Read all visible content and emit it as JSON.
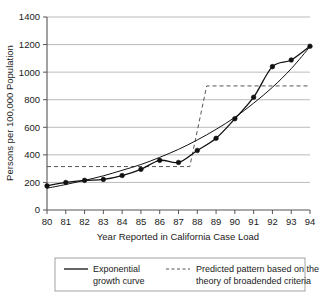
{
  "chart_data": {
    "type": "line",
    "title": "",
    "xlabel": "Year Reported in California Case Load",
    "ylabel": "Persons per 100,000 Population",
    "x": [
      80,
      81,
      82,
      83,
      84,
      85,
      86,
      87,
      88,
      89,
      90,
      91,
      92,
      93,
      94
    ],
    "xticklabels": [
      "80",
      "81",
      "82",
      "83",
      "84",
      "85",
      "86",
      "87",
      "88",
      "89",
      "90",
      "91",
      "92",
      "93",
      "94"
    ],
    "xlim": [
      80,
      94
    ],
    "ylim": [
      0,
      1400
    ],
    "yticks": [
      0,
      200,
      400,
      600,
      800,
      1000,
      1200,
      1400
    ],
    "yticklabels": [
      "0",
      "200",
      "400",
      "600",
      "800",
      "1000",
      "1200",
      "1400"
    ],
    "grid": "horizontal",
    "legend_position": "below-axes",
    "series": [
      {
        "name": "Observed case load (markers)",
        "style": "solid-with-markers",
        "values": [
          175,
          200,
          215,
          222,
          250,
          295,
          360,
          345,
          432,
          520,
          662,
          818,
          1040,
          1088,
          1188
        ]
      },
      {
        "name": "Exponential growth curve",
        "style": "solid",
        "values": [
          158,
          185,
          215,
          248,
          288,
          330,
          382,
          440,
          508,
          585,
          672,
          775,
          890,
          1025,
          1185
        ]
      },
      {
        "name": "Predicted pattern based on the theory of broadended criteria",
        "style": "dashed-step",
        "step_low": 315,
        "step_high": 900,
        "step_start_x": 80,
        "step_rise_from_x": 87.6,
        "step_rise_to_x": 88.5,
        "step_end_x": 94,
        "values": [
          315,
          315,
          315,
          315,
          315,
          315,
          315,
          315,
          900,
          900,
          900,
          900,
          900,
          900,
          900
        ]
      }
    ],
    "annotations": []
  },
  "legend": {
    "entries": [
      {
        "swatch": "solid-line",
        "line1": "Exponential",
        "line2": "growth curve"
      },
      {
        "swatch": "dashed-line",
        "line1": "Predicted pattern based on the",
        "line2": "theory of broadended criteria"
      }
    ]
  },
  "colors": {
    "line": "#111111",
    "dashed": "#555555",
    "grid": "#aaaaaa",
    "axis": "#555555",
    "background": "#ffffff"
  }
}
